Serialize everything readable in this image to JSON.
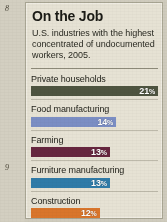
{
  "page": {
    "markers": [
      {
        "id": "top",
        "label": "8"
      },
      {
        "id": "bottom",
        "label": "9"
      }
    ]
  },
  "card": {
    "title": "On the Job",
    "subtitle": "U.S. industries with the highest concentrated of undocumented workers, 2005.",
    "background_color": "#e6e2d4",
    "border_color": "#a9a694"
  },
  "chart_data": {
    "type": "bar",
    "orientation": "horizontal",
    "title": "On the Job",
    "subtitle": "U.S. industries with the highest concentrated of undocumented workers, 2005.",
    "xlabel": "",
    "ylabel": "",
    "unit": "%",
    "grid": false,
    "legend": "none",
    "xlim": [
      0,
      21
    ],
    "categories": [
      "Private households",
      "Food manufacturing",
      "Farming",
      "Furniture manufacturing",
      "Construction"
    ],
    "values": [
      21,
      14,
      13,
      13,
      12
    ],
    "value_labels": [
      "21%",
      "14%",
      "13%",
      "13%",
      "12%"
    ],
    "colors": [
      "#4e5440",
      "#7b8ec4",
      "#66263f",
      "#2f7ba8",
      "#d9752b"
    ],
    "bars": [
      {
        "label": "Private households",
        "value": 21,
        "value_label": "21",
        "suffix": "%",
        "color": "#4e5440",
        "width_pct": 100
      },
      {
        "label": "Food manufacturing",
        "value": 14,
        "value_label": "14",
        "suffix": "%",
        "color": "#7b8ec4",
        "width_pct": 67
      },
      {
        "label": "Farming",
        "value": 13,
        "value_label": "13",
        "suffix": "%",
        "color": "#66263f",
        "width_pct": 62
      },
      {
        "label": "Furniture manufacturing",
        "value": 13,
        "value_label": "13",
        "suffix": "%",
        "color": "#2f7ba8",
        "width_pct": 62
      },
      {
        "label": "Construction",
        "value": 12,
        "value_label": "12",
        "suffix": "%",
        "color": "#d9752b",
        "width_pct": 54
      }
    ]
  }
}
